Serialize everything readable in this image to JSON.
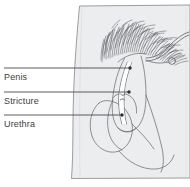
{
  "figure": {
    "name": "anatomical-line-drawing-male-genitalia-with-urethral-stricture",
    "background_color": "#ffffff",
    "body_fill_color": "#ececed",
    "line_color": "#6b6b70",
    "label_color": "#3d3d3d",
    "width": 190,
    "height": 187
  },
  "labels": [
    {
      "id": "penis",
      "text": "Penis",
      "leader_start_x": 4,
      "leader_start_y": 68,
      "leader_end_x": 130,
      "leader_end_y": 68,
      "dot_x": 130,
      "dot_y": 68
    },
    {
      "id": "stricture",
      "text": "Stricture",
      "leader_start_x": 4,
      "leader_start_y": 92,
      "leader_end_x": 129,
      "leader_end_y": 92,
      "dot_x": 129,
      "dot_y": 92
    },
    {
      "id": "urethra",
      "text": "Urethra",
      "leader_start_x": 4,
      "leader_start_y": 115,
      "leader_end_x": 122,
      "leader_end_y": 115,
      "dot_x": 122,
      "dot_y": 115
    }
  ],
  "parts": {
    "pubic_hair": "pubic-hair-texture",
    "shaft": "penile-shaft",
    "scrotum": "scrotum",
    "urethral_channel": "urethral-channel",
    "catheter_loop": "catheter-tube-loop",
    "body_panel": "torso-thigh-panel"
  }
}
